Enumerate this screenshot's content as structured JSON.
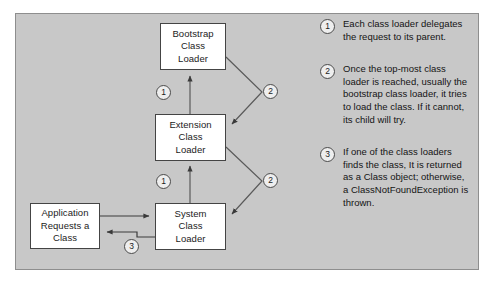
{
  "diagram": {
    "panel": {
      "background_color": "#c8c8c8",
      "border_color": "#8e8e8e"
    },
    "nodes": [
      {
        "id": "bootstrap",
        "label_lines": [
          "Bootstrap",
          "Class",
          "Loader"
        ],
        "line1": "Bootstrap",
        "line2": "Class",
        "line3": "Loader"
      },
      {
        "id": "extension",
        "label_lines": [
          "Extension",
          "Class",
          "Loader"
        ],
        "line1": "Extension",
        "line2": "Class",
        "line3": "Loader"
      },
      {
        "id": "system",
        "label_lines": [
          "System",
          "Class",
          "Loader"
        ],
        "line1": "System",
        "line2": "Class",
        "line3": "Loader"
      },
      {
        "id": "application",
        "label_lines": [
          "Application",
          "Requests a",
          "Class"
        ],
        "line1": "Application",
        "line2": "Requests a",
        "line3": "Class"
      }
    ],
    "edge_markers": [
      {
        "id": "system-to-extension",
        "number": "1"
      },
      {
        "id": "extension-to-bootstrap",
        "number": "1"
      },
      {
        "id": "bootstrap-to-extension",
        "number": "2"
      },
      {
        "id": "extension-to-system",
        "number": "2"
      },
      {
        "id": "system-to-application",
        "number": "3"
      }
    ]
  },
  "legend": {
    "items": [
      {
        "number": "1",
        "text": "Each class loader delegates the request to its parent."
      },
      {
        "number": "2",
        "text": "Once the top-most class loader is reached, usually the bootstrap class loader, it tries to load the class. If it cannot, its child will try."
      },
      {
        "number": "3",
        "text": "If one of the class loaders finds the class, It is returned as a Class object; otherwise, a ClassNotFoundException is thrown."
      }
    ]
  }
}
